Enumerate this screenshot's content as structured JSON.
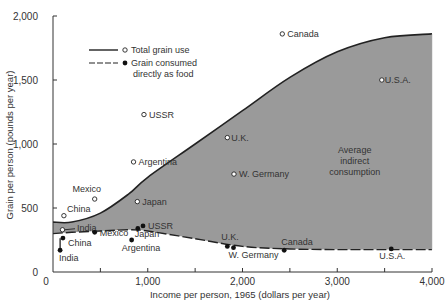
{
  "chart_data": {
    "type": "area",
    "title": "",
    "xlabel": "Income per person, 1965 (dollars per year)",
    "ylabel": "Grain per person (pounds per year)",
    "xlim": [
      0,
      4000
    ],
    "ylim": [
      0,
      2000
    ],
    "x_ticks": [
      "0",
      "1,000",
      "2,000",
      "3,000",
      "4,000"
    ],
    "y_ticks": [
      "0",
      "500",
      "1,000",
      "1,500",
      "2,000"
    ],
    "grid": false,
    "legend": {
      "position": "upper-left",
      "entries": [
        {
          "label": "Total grain use",
          "style": "solid line, open circle"
        },
        {
          "label": "Grain consumed directly as food",
          "label_lines": [
            "Grain consumed",
            "directly as food"
          ],
          "style": "dashed line, filled circle"
        }
      ]
    },
    "annotations": [
      {
        "text": "Average indirect consumption",
        "lines": [
          "Average",
          "indirect",
          "consumption"
        ],
        "x": 3100,
        "y": 870
      }
    ],
    "series": [
      {
        "name": "Total grain use (trend curve)",
        "x": [
          0,
          200,
          500,
          800,
          1000,
          1500,
          2000,
          2500,
          3000,
          3500,
          4000
        ],
        "y": [
          390,
          390,
          460,
          610,
          740,
          1000,
          1260,
          1520,
          1720,
          1830,
          1860
        ]
      },
      {
        "name": "Grain consumed directly as food (trend curve)",
        "x": [
          0,
          200,
          500,
          800,
          1000,
          1500,
          2000,
          2500,
          3000,
          3500,
          4000
        ],
        "y": [
          300,
          310,
          320,
          330,
          320,
          260,
          200,
          180,
          175,
          175,
          175
        ]
      },
      {
        "name": "Total grain use (countries)",
        "points": [
          {
            "label": "China",
            "x": 115,
            "y": 440
          },
          {
            "label": "India",
            "x": 100,
            "y": 330
          },
          {
            "label": "Mexico",
            "x": 440,
            "y": 570
          },
          {
            "label": "Japan",
            "x": 890,
            "y": 550
          },
          {
            "label": "Argentina",
            "x": 850,
            "y": 860
          },
          {
            "label": "USSR",
            "x": 960,
            "y": 1230
          },
          {
            "label": "U.K.",
            "x": 1840,
            "y": 1050
          },
          {
            "label": "W. Germany",
            "x": 1910,
            "y": 765
          },
          {
            "label": "Canada",
            "x": 2420,
            "y": 1860
          },
          {
            "label": "U.S.A.",
            "x": 3470,
            "y": 1500
          }
        ]
      },
      {
        "name": "Grain consumed directly as food (countries)",
        "points": [
          {
            "label": "India",
            "x": 75,
            "y": 170
          },
          {
            "label": "China",
            "x": 105,
            "y": 265
          },
          {
            "label": "Mexico",
            "x": 440,
            "y": 310
          },
          {
            "label": "Argentina",
            "x": 830,
            "y": 250
          },
          {
            "label": "Japan",
            "x": 895,
            "y": 340
          },
          {
            "label": "USSR",
            "x": 950,
            "y": 360
          },
          {
            "label": "U.K.",
            "x": 1840,
            "y": 200
          },
          {
            "label": "W. Germany",
            "x": 1905,
            "y": 190
          },
          {
            "label": "Canada",
            "x": 2440,
            "y": 170
          },
          {
            "label": "U.S.A.",
            "x": 3570,
            "y": 180
          }
        ]
      }
    ]
  },
  "colors": {
    "fill": "#9a9a9a",
    "line": "#222222",
    "text": "#333333"
  }
}
